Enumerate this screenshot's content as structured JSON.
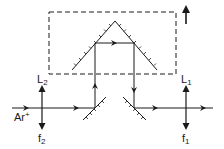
{
  "diagram": {
    "type": "optical-setup",
    "labels": {
      "source": "Ar",
      "source_sup": "+",
      "lens2": "L",
      "lens2_sub": "2",
      "lens2_focal": "f",
      "lens2_focal_sub": "2",
      "lens1": "L",
      "lens1_sub": "1",
      "lens1_focal": "f",
      "lens1_focal_sub": "1"
    },
    "elements": [
      {
        "name": "Ar+ laser input beam",
        "kind": "beam"
      },
      {
        "name": "lens L2",
        "kind": "lens",
        "focal": "f2"
      },
      {
        "name": "input steering mirror",
        "kind": "mirror"
      },
      {
        "name": "roof mirror (movable stage)",
        "kind": "mirror"
      },
      {
        "name": "output steering mirror",
        "kind": "mirror"
      },
      {
        "name": "lens L1",
        "kind": "lens",
        "focal": "f1"
      },
      {
        "name": "translation direction arrow",
        "kind": "arrow"
      }
    ],
    "colors": {
      "ink": "#1a1a1a",
      "background": "#ffffff"
    }
  }
}
